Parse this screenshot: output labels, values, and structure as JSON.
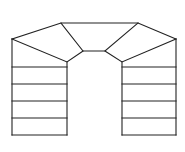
{
  "diagram": {
    "type": "stair-plan",
    "colors": {
      "stroke": "#222222",
      "background": "#ffffff"
    },
    "left_flight": {
      "x": 12,
      "width": 55,
      "treads_y": [
        67,
        84,
        101,
        118,
        135
      ]
    },
    "right_flight": {
      "x": 122,
      "width": 54,
      "treads_y": [
        67,
        84,
        101,
        118,
        135
      ]
    }
  }
}
